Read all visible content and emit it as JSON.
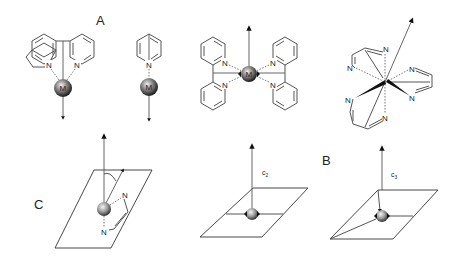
{
  "figure": {
    "panel_labels": {
      "A": "A",
      "B": "B",
      "C": "C"
    },
    "metal_label": "M",
    "nitrogen_label": "N",
    "axis_labels": {
      "c2_main": "c",
      "c2_sub": "2",
      "c3_main": "c",
      "c3_sub": "3"
    },
    "structures": [
      {
        "id": "bipyridine-chelate",
        "description": "2,2'-bipyridine chelating metal M, dipole arrow pointing down"
      },
      {
        "id": "pyridine-monodentate",
        "description": "pyridine coordinated to M, dipole arrow pointing down"
      },
      {
        "id": "bis-bipyridine-planar",
        "description": "two bipyridines around M, arrow up"
      },
      {
        "id": "tris-diimine-octahedral",
        "description": "three diimine chelates around metal, tilted arrow"
      },
      {
        "id": "chelate-in-plane-tilted",
        "description": "metal on plane with chelate, angle between axis and tilted arrow"
      },
      {
        "id": "c2-axis-plane",
        "description": "metal on plane with C2 axis"
      },
      {
        "id": "c3-axis-plane",
        "description": "metal on plane with C3 axis"
      }
    ],
    "colors": {
      "line": "#555555",
      "sphere_light": "#e6e6e6",
      "sphere_dark": "#222222",
      "background": "#ffffff"
    }
  }
}
